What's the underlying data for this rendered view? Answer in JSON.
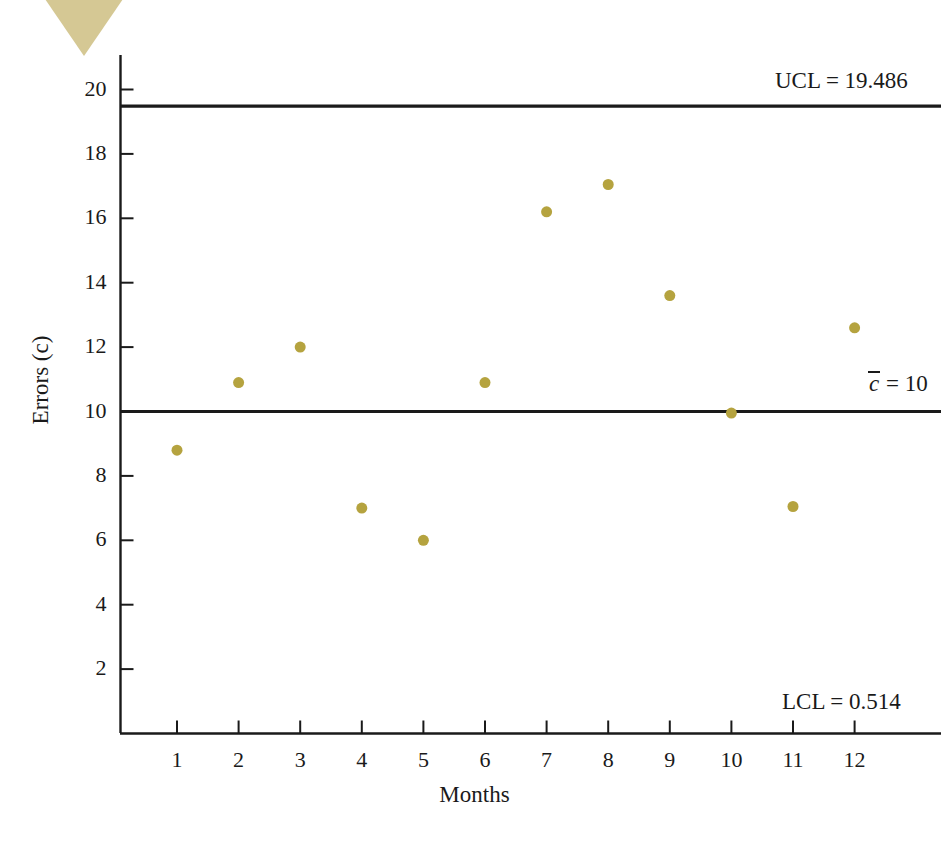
{
  "chart_data": {
    "type": "scatter",
    "title": "",
    "subtitle": "",
    "xlabel": "Months",
    "ylabel": "Errors (c)",
    "ylabel_parts": {
      "prefix": "Errors (",
      "italic": "c",
      "suffix": ")"
    },
    "categories": [
      1,
      2,
      3,
      4,
      5,
      6,
      7,
      8,
      9,
      10,
      11,
      12
    ],
    "x": [
      1,
      2,
      3,
      4,
      5,
      6,
      7,
      8,
      9,
      10,
      11,
      12
    ],
    "values": [
      8.8,
      10.9,
      12.0,
      7.0,
      6.0,
      10.9,
      16.2,
      17.05,
      13.6,
      9.95,
      7.05,
      12.6
    ],
    "series": [
      {
        "name": "Errors (c)",
        "values": [
          8.8,
          10.9,
          12.0,
          7.0,
          6.0,
          10.9,
          16.2,
          17.05,
          13.6,
          9.95,
          7.05,
          12.6
        ],
        "marker_color": "#b5a33f",
        "marker_size": 11
      }
    ],
    "xlim": [
      0.45,
      12.55
    ],
    "ylim": [
      0,
      21.4
    ],
    "yticks": [
      2,
      4,
      6,
      8,
      10,
      12,
      14,
      16,
      18,
      20
    ],
    "xticks": [
      1,
      2,
      3,
      4,
      5,
      6,
      7,
      8,
      9,
      10,
      11,
      12
    ],
    "xtick_labels": [
      "1",
      "2",
      "3",
      "4",
      "5",
      "6",
      "7",
      "8",
      "9",
      "10",
      "11",
      "12"
    ],
    "ytick_labels": [
      "2",
      "4",
      "6",
      "8",
      "10",
      "12",
      "14",
      "16",
      "18",
      "20"
    ],
    "grid": false,
    "legend": "none",
    "control_lines": [
      {
        "id": "ucl",
        "label": "UCL = 19.486",
        "value": 19.486,
        "color": "#1a1a1a"
      },
      {
        "id": "center",
        "label_prefix": "",
        "label_symbol": "c",
        "label_suffix": " = 10",
        "label": "c̄ = 10",
        "value": 10,
        "color": "#1a1a1a"
      },
      {
        "id": "lcl",
        "label": "LCL = 0.514",
        "value": 0.514,
        "color": "#1a1a1a",
        "line_drawn": false
      }
    ],
    "annotations": [
      {
        "name": "ucl-annotation",
        "text": "UCL = 19.486"
      },
      {
        "name": "center-line-annotation",
        "text": "c̄ = 10"
      },
      {
        "name": "lcl-annotation",
        "text": "LCL = 0.514"
      }
    ],
    "axis_color": "#1a1a1a",
    "background": "#ffffff"
  },
  "decoration": {
    "corner_triangle_color": "#d5c894",
    "corner_triangle_name": "page-corner-triangle"
  }
}
